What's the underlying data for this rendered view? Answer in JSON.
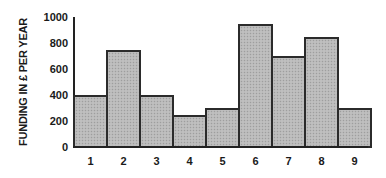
{
  "chart_data": {
    "type": "bar",
    "title": "",
    "xlabel": "",
    "ylabel": "FUNDING IN £ PER YEAR",
    "categories": [
      "1",
      "2",
      "3",
      "4",
      "5",
      "6",
      "7",
      "8",
      "9"
    ],
    "values": [
      400,
      750,
      400,
      250,
      300,
      950,
      700,
      850,
      300
    ],
    "ylim": [
      0,
      1000
    ],
    "yticks": [
      "0",
      "200",
      "400",
      "600",
      "800",
      "1000"
    ],
    "grid": false,
    "legend": null,
    "bar_gap": 0,
    "bar_color": "#b9b9b9",
    "bar_edge_color": "#2b2b2b"
  }
}
